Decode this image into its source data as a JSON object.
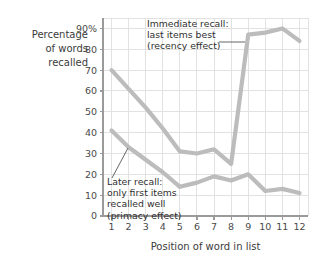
{
  "chart_data": {
    "type": "line",
    "title": "",
    "xlabel": "Position of word in list",
    "ylabel": "Percentage of words recalled",
    "ylabel_lines": [
      "Percentage",
      "of words",
      "recalled"
    ],
    "categories": [
      1,
      2,
      3,
      4,
      5,
      6,
      7,
      8,
      9,
      10,
      11,
      12
    ],
    "x": [
      1,
      2,
      3,
      4,
      5,
      6,
      7,
      8,
      9,
      10,
      11,
      12
    ],
    "xlim": [
      0.5,
      12.5
    ],
    "ylim": [
      0,
      95
    ],
    "ytick_labels": [
      "0",
      "10",
      "20",
      "30",
      "40",
      "50",
      "60",
      "70",
      "80",
      "90%"
    ],
    "ytick_values": [
      0,
      10,
      20,
      30,
      40,
      50,
      60,
      70,
      80,
      90
    ],
    "xtick_labels": [
      "1",
      "2",
      "3",
      "4",
      "5",
      "6",
      "7",
      "8",
      "9",
      "10",
      "11",
      "12"
    ],
    "grid": true,
    "legend_position": "none",
    "series": [
      {
        "name": "Immediate recall",
        "values": [
          70,
          61,
          52,
          42,
          31,
          30,
          32,
          25,
          87,
          88,
          90,
          84
        ],
        "color": "#bcbcbc"
      },
      {
        "name": "Later recall",
        "values": [
          41,
          33,
          27,
          21,
          14,
          16,
          19,
          17,
          20,
          12,
          13,
          11
        ],
        "color": "#bcbcbc"
      }
    ],
    "annotations": [
      {
        "id": "immediate-recall-annotation",
        "lines": [
          "Immediate recall:",
          "last items best",
          "(recency effect)"
        ],
        "text_x": 147,
        "text_y": 27,
        "leader": {
          "x1": 219,
          "y1": 42,
          "x2": 245,
          "y2": 42
        }
      },
      {
        "id": "later-recall-annotation",
        "lines": [
          "Later recall:",
          "only first items",
          "recalled well",
          "(primacy effect)"
        ],
        "text_x": 107,
        "text_y": 185,
        "leader": {
          "x1": 112,
          "y1": 178,
          "x2": 128,
          "y2": 148
        }
      }
    ],
    "colors": {
      "line": "#bcbcbc",
      "grid": "#e2e2e2",
      "axis": "#9a9a9a",
      "text": "#3b3b3b"
    }
  }
}
